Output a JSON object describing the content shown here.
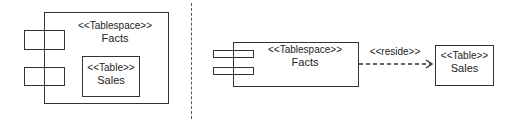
{
  "left_diagram": {
    "container": {
      "stereotype": "<<Tablespace>>",
      "name": "Facts"
    },
    "nested": {
      "stereotype": "<<Table>>",
      "name": "Sales"
    }
  },
  "right_diagram": {
    "component": {
      "stereotype": "<<Tablespace>>",
      "name": "Facts"
    },
    "target": {
      "stereotype": "<<Table>>",
      "name": "Sales"
    },
    "dependency": {
      "label": "<<reside>>",
      "style": "dashed",
      "arrow": "open"
    }
  },
  "colors": {
    "line": "#333333",
    "background": "#ffffff",
    "separator": "#555555"
  }
}
